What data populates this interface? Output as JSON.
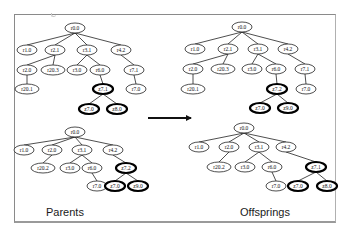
{
  "figure": {
    "left_caption": "Parents",
    "right_caption": "Offsprings",
    "arrow": {
      "from": [
        148,
        118
      ],
      "to": [
        191,
        118
      ],
      "color": "#111111"
    },
    "colors": {
      "node_border": "#222222",
      "highlight_border": "#000000",
      "edge": "#222222",
      "frame": "#8a8a8a"
    }
  },
  "trees": [
    {
      "id": "parent-1",
      "nodes": [
        {
          "id": "a0",
          "label": "r0.0",
          "x": 75,
          "y": 28,
          "hl": false
        },
        {
          "id": "a1",
          "label": "r1.0",
          "x": 27,
          "y": 50,
          "hl": false
        },
        {
          "id": "a2",
          "label": "r2.1",
          "x": 55,
          "y": 50,
          "hl": false
        },
        {
          "id": "a3",
          "label": "r3.1",
          "x": 87,
          "y": 50,
          "hl": false
        },
        {
          "id": "a4",
          "label": "r4.2",
          "x": 121,
          "y": 50,
          "hl": false
        },
        {
          "id": "a5",
          "label": "r2.0",
          "x": 27,
          "y": 70,
          "hl": false
        },
        {
          "id": "a6",
          "label": "r20.3",
          "x": 53,
          "y": 70,
          "hl": false
        },
        {
          "id": "a7",
          "label": "r3.0",
          "x": 77,
          "y": 70,
          "hl": false
        },
        {
          "id": "a8",
          "label": "r6.0",
          "x": 100,
          "y": 70,
          "hl": false
        },
        {
          "id": "a9",
          "label": "r7.1",
          "x": 134,
          "y": 70,
          "hl": false
        },
        {
          "id": "a10",
          "label": "r20.1",
          "x": 27,
          "y": 89,
          "hl": false
        },
        {
          "id": "a11",
          "label": "z7.1",
          "x": 103,
          "y": 89,
          "hl": true
        },
        {
          "id": "a12",
          "label": "r7.0",
          "x": 136,
          "y": 89,
          "hl": false
        },
        {
          "id": "a13",
          "label": "z7.0",
          "x": 89,
          "y": 109,
          "hl": true
        },
        {
          "id": "a14",
          "label": "z8.0",
          "x": 117,
          "y": 109,
          "hl": true
        }
      ],
      "edges": [
        [
          "a0",
          "a1"
        ],
        [
          "a0",
          "a2"
        ],
        [
          "a0",
          "a3"
        ],
        [
          "a0",
          "a4"
        ],
        [
          "a2",
          "a5"
        ],
        [
          "a2",
          "a6"
        ],
        [
          "a3",
          "a7"
        ],
        [
          "a3",
          "a8"
        ],
        [
          "a4",
          "a9"
        ],
        [
          "a5",
          "a10"
        ],
        [
          "a8",
          "a11"
        ],
        [
          "a9",
          "a12"
        ],
        [
          "a11",
          "a13"
        ],
        [
          "a11",
          "a14"
        ]
      ]
    },
    {
      "id": "parent-2",
      "nodes": [
        {
          "id": "b0",
          "label": "r0.0",
          "x": 75,
          "y": 132,
          "hl": false
        },
        {
          "id": "b1",
          "label": "r1.0",
          "x": 24,
          "y": 150,
          "hl": false
        },
        {
          "id": "b2",
          "label": "r2.0",
          "x": 52,
          "y": 150,
          "hl": false
        },
        {
          "id": "b3",
          "label": "r3.1",
          "x": 82,
          "y": 150,
          "hl": false
        },
        {
          "id": "b4",
          "label": "r4.2",
          "x": 113,
          "y": 150,
          "hl": false
        },
        {
          "id": "b5",
          "label": "r20.2",
          "x": 43,
          "y": 168,
          "hl": false
        },
        {
          "id": "b6",
          "label": "r3.0",
          "x": 70,
          "y": 168,
          "hl": false
        },
        {
          "id": "b7",
          "label": "r6.0",
          "x": 92,
          "y": 168,
          "hl": false
        },
        {
          "id": "b8",
          "label": "z7.2",
          "x": 126,
          "y": 168,
          "hl": true
        },
        {
          "id": "b9",
          "label": "r7.0",
          "x": 97,
          "y": 186,
          "hl": false
        },
        {
          "id": "b10",
          "label": "z7.0",
          "x": 115,
          "y": 186,
          "hl": true
        },
        {
          "id": "b11",
          "label": "z9.0",
          "x": 138,
          "y": 186,
          "hl": true
        }
      ],
      "edges": [
        [
          "b0",
          "b1"
        ],
        [
          "b0",
          "b2"
        ],
        [
          "b0",
          "b3"
        ],
        [
          "b0",
          "b4"
        ],
        [
          "b2",
          "b5"
        ],
        [
          "b3",
          "b6"
        ],
        [
          "b3",
          "b7"
        ],
        [
          "b4",
          "b8"
        ],
        [
          "b7",
          "b9"
        ],
        [
          "b8",
          "b10"
        ],
        [
          "b8",
          "b11"
        ]
      ]
    },
    {
      "id": "offspring-1",
      "nodes": [
        {
          "id": "c0",
          "label": "r0.0",
          "x": 242,
          "y": 27,
          "hl": false
        },
        {
          "id": "c1",
          "label": "r1.0",
          "x": 195,
          "y": 49,
          "hl": false
        },
        {
          "id": "c2",
          "label": "r2.1",
          "x": 228,
          "y": 49,
          "hl": false
        },
        {
          "id": "c3",
          "label": "r3.1",
          "x": 258,
          "y": 49,
          "hl": false
        },
        {
          "id": "c4",
          "label": "r4.2",
          "x": 288,
          "y": 49,
          "hl": false
        },
        {
          "id": "c5",
          "label": "r2.0",
          "x": 193,
          "y": 69,
          "hl": false
        },
        {
          "id": "c6",
          "label": "r20.3",
          "x": 223,
          "y": 69,
          "hl": false
        },
        {
          "id": "c7",
          "label": "r3.0",
          "x": 252,
          "y": 69,
          "hl": false
        },
        {
          "id": "c8",
          "label": "r6.0",
          "x": 276,
          "y": 69,
          "hl": false
        },
        {
          "id": "c9",
          "label": "r7.1",
          "x": 305,
          "y": 69,
          "hl": false
        },
        {
          "id": "c10",
          "label": "r20.1",
          "x": 193,
          "y": 89,
          "hl": false
        },
        {
          "id": "c11",
          "label": "z7.2",
          "x": 277,
          "y": 89,
          "hl": true
        },
        {
          "id": "c12",
          "label": "r7.0",
          "x": 306,
          "y": 89,
          "hl": false
        },
        {
          "id": "c13",
          "label": "z7.0",
          "x": 260,
          "y": 108,
          "hl": true
        },
        {
          "id": "c14",
          "label": "z9.0",
          "x": 288,
          "y": 108,
          "hl": true
        }
      ],
      "edges": [
        [
          "c0",
          "c1"
        ],
        [
          "c0",
          "c2"
        ],
        [
          "c0",
          "c3"
        ],
        [
          "c0",
          "c4"
        ],
        [
          "c2",
          "c5"
        ],
        [
          "c2",
          "c6"
        ],
        [
          "c3",
          "c7"
        ],
        [
          "c3",
          "c8"
        ],
        [
          "c4",
          "c9"
        ],
        [
          "c5",
          "c10"
        ],
        [
          "c8",
          "c11"
        ],
        [
          "c9",
          "c12"
        ],
        [
          "c11",
          "c13"
        ],
        [
          "c11",
          "c14"
        ]
      ]
    },
    {
      "id": "offspring-2",
      "nodes": [
        {
          "id": "d0",
          "label": "r0.0",
          "x": 244,
          "y": 128,
          "hl": false
        },
        {
          "id": "d1",
          "label": "r1.0",
          "x": 199,
          "y": 147,
          "hl": false
        },
        {
          "id": "d2",
          "label": "r2.0",
          "x": 229,
          "y": 147,
          "hl": false
        },
        {
          "id": "d3",
          "label": "r3.1",
          "x": 259,
          "y": 147,
          "hl": false
        },
        {
          "id": "d4",
          "label": "r4.2",
          "x": 286,
          "y": 147,
          "hl": false
        },
        {
          "id": "d5",
          "label": "r20.2",
          "x": 219,
          "y": 167,
          "hl": false
        },
        {
          "id": "d6",
          "label": "r3.0",
          "x": 245,
          "y": 167,
          "hl": false
        },
        {
          "id": "d7",
          "label": "r6.0",
          "x": 272,
          "y": 167,
          "hl": false
        },
        {
          "id": "d8",
          "label": "z7.1",
          "x": 316,
          "y": 167,
          "hl": true
        },
        {
          "id": "d9",
          "label": "r7.0",
          "x": 276,
          "y": 186,
          "hl": false
        },
        {
          "id": "d10",
          "label": "z7.0",
          "x": 298,
          "y": 186,
          "hl": true
        },
        {
          "id": "d11",
          "label": "z8.0",
          "x": 327,
          "y": 186,
          "hl": true
        }
      ],
      "edges": [
        [
          "d0",
          "d1"
        ],
        [
          "d0",
          "d2"
        ],
        [
          "d0",
          "d3"
        ],
        [
          "d0",
          "d4"
        ],
        [
          "d2",
          "d5"
        ],
        [
          "d3",
          "d6"
        ],
        [
          "d3",
          "d7"
        ],
        [
          "d4",
          "d8"
        ],
        [
          "d7",
          "d9"
        ],
        [
          "d8",
          "d10"
        ],
        [
          "d8",
          "d11"
        ]
      ]
    }
  ]
}
